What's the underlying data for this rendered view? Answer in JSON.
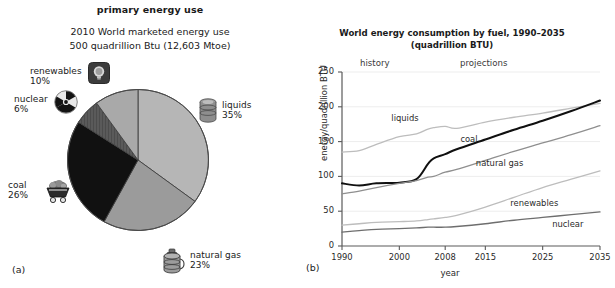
{
  "figure": {
    "panel_a_label": "(a)",
    "panel_b_label": "(b)"
  },
  "pie": {
    "title": "primary energy use",
    "subtitle_line1": "2010 World marketed energy use",
    "subtitle_line2": "500 quadrillion Btu (12,603 Mtoe)",
    "slices": [
      {
        "label": "liquids",
        "percent_text": "35%",
        "value": 35,
        "color": "#b6b6b6",
        "icon": "oil-barrel-icon"
      },
      {
        "label": "natural gas",
        "percent_text": "23%",
        "value": 23,
        "color": "#9b9b9b",
        "icon": "gas-canister-icon"
      },
      {
        "label": "coal",
        "percent_text": "26%",
        "value": 26,
        "color": "#111111",
        "icon": "coal-cart-icon"
      },
      {
        "label": "nuclear",
        "percent_text": "6%",
        "value": 6,
        "color": "#4d4d4d",
        "icon": "radiation-icon"
      },
      {
        "label": "renewables",
        "percent_text": "10%",
        "value": 10,
        "color": "#a9a9a9",
        "icon": "lightbulb-icon"
      }
    ]
  },
  "chart_data": {
    "type": "line",
    "title": "World energy consumption by fuel, 1990–2035",
    "subtitle": "(quadrillion BTU)",
    "xlabel": "year",
    "ylabel": "energy/quadrillion BTU",
    "xlim": [
      1990,
      2035
    ],
    "ylim": [
      0,
      250
    ],
    "xticks": [
      "1990",
      "2000",
      "2008",
      "2015",
      "2025",
      "2035"
    ],
    "xtick_values": [
      1990,
      2000,
      2008,
      2015,
      2025,
      2035
    ],
    "yticks": [
      "0",
      "50",
      "100",
      "150",
      "200",
      "250"
    ],
    "ytick_values": [
      0,
      50,
      100,
      150,
      200,
      250
    ],
    "grid": true,
    "legend_position": "inline-labels",
    "annotations": [
      {
        "text": "history",
        "x": 1999,
        "y": 243
      },
      {
        "text": "projections",
        "x": 2022,
        "y": 243
      }
    ],
    "x": [
      1990,
      1993,
      1996,
      2000,
      2003,
      2005,
      2006,
      2008,
      2010,
      2015,
      2020,
      2025,
      2030,
      2035
    ],
    "series": [
      {
        "name": "liquids",
        "color": "#bdbdbd",
        "width": 1.3,
        "values": [
          135,
          137,
          146,
          157,
          161,
          168,
          170,
          172,
          169,
          178,
          185,
          191,
          198,
          205
        ]
      },
      {
        "name": "coal",
        "color": "#101010",
        "width": 2.0,
        "values": [
          90,
          87,
          90,
          91,
          96,
          118,
          126,
          132,
          139,
          153,
          167,
          180,
          194,
          209
        ]
      },
      {
        "name": "natural gas",
        "color": "#8f8f8f",
        "width": 1.3,
        "values": [
          75,
          79,
          84,
          90,
          94,
          99,
          100,
          106,
          110,
          123,
          136,
          148,
          160,
          173
        ]
      },
      {
        "name": "renewables",
        "color": "#bdbdbd",
        "width": 1.3,
        "values": [
          30,
          32,
          34,
          35,
          36,
          38,
          39,
          41,
          44,
          56,
          70,
          84,
          96,
          108
        ]
      },
      {
        "name": "nuclear",
        "color": "#6e6e6e",
        "width": 1.3,
        "values": [
          20,
          22,
          24,
          25,
          26,
          27,
          27,
          27,
          28,
          32,
          37,
          41,
          45,
          49
        ]
      }
    ],
    "series_labels": [
      {
        "name": "liquids",
        "label": "liquids"
      },
      {
        "name": "coal",
        "label": "coal"
      },
      {
        "name": "natural gas",
        "label": "natural gas"
      },
      {
        "name": "renewables",
        "label": "renewables"
      },
      {
        "name": "nuclear",
        "label": "nuclear"
      }
    ]
  }
}
